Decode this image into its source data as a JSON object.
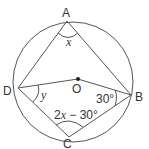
{
  "diagram": {
    "type": "circle-geometry",
    "circle": {
      "cx": 73,
      "cy": 82,
      "r": 60,
      "stroke": "#555555"
    },
    "center": {
      "name": "O",
      "x": 78,
      "y": 79,
      "label": "O"
    },
    "points": {
      "A": {
        "label": "A",
        "x": 67,
        "y": 21
      },
      "B": {
        "label": "B",
        "x": 131,
        "y": 95
      },
      "C": {
        "label": "C",
        "x": 69,
        "y": 137
      },
      "D": {
        "label": "D",
        "x": 18,
        "y": 88
      }
    },
    "segments": [
      [
        "A",
        "B"
      ],
      [
        "A",
        "D"
      ],
      [
        "D",
        "O"
      ],
      [
        "O",
        "B"
      ],
      [
        "D",
        "C"
      ],
      [
        "C",
        "B"
      ]
    ],
    "angles": {
      "A": {
        "label": "x",
        "vertex": "A"
      },
      "D": {
        "label": "y",
        "vertex": "D",
        "between": [
          "O",
          "C"
        ]
      },
      "B": {
        "label": "30°",
        "vertex": "B",
        "between": [
          "O",
          "C"
        ]
      },
      "C": {
        "label_prefix": "2",
        "label_var": "x",
        "label_suffix": " − 30°",
        "vertex": "C"
      }
    }
  }
}
